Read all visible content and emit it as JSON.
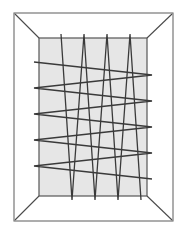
{
  "figure": {
    "canvas": {
      "width": 181,
      "height": 236,
      "background": "#ffffff"
    },
    "colors": {
      "outer_boundary_stroke": "#6b6b6b",
      "inner_region_fill": "#e6e6e6",
      "inner_region_stroke": "#555555",
      "path_stroke": "#3a3a3a",
      "corner_link_stroke": "#4a4a4a"
    },
    "stroke_widths": {
      "outer_boundary": 1.1,
      "inner_region": 1.2,
      "path": 1.3,
      "corner_link": 1.1
    },
    "outer_boundary": {
      "x": 14,
      "y": 13,
      "width": 159,
      "height": 208
    },
    "inner_region": {
      "x": 39,
      "y": 38,
      "width": 108,
      "height": 158
    },
    "corner_links": [
      {
        "name": "top-left",
        "x1": 15,
        "y1": 14,
        "x2": 39,
        "y2": 38
      },
      {
        "name": "top-right",
        "x1": 172,
        "y1": 14,
        "x2": 147,
        "y2": 38
      },
      {
        "name": "bottom-left",
        "x1": 15,
        "y1": 220,
        "x2": 39,
        "y2": 196
      },
      {
        "name": "bottom-right",
        "x1": 172,
        "y1": 220,
        "x2": 147,
        "y2": 196
      }
    ],
    "vertical_sweep": {
      "label": "vertical zigzag sweep",
      "overshoot_top": 4,
      "overshoot_bottom": 4,
      "points": [
        [
          61,
          34
        ],
        [
          72,
          200
        ],
        [
          84,
          34
        ],
        [
          95,
          200
        ],
        [
          107,
          34
        ],
        [
          118,
          200
        ],
        [
          130,
          34
        ],
        [
          141,
          200
        ]
      ]
    },
    "horizontal_sweep": {
      "label": "horizontal zigzag sweep",
      "overshoot_left": 5,
      "overshoot_right": 5,
      "points": [
        [
          34,
          62
        ],
        [
          152,
          75
        ],
        [
          34,
          88
        ],
        [
          152,
          101
        ],
        [
          34,
          114
        ],
        [
          152,
          127
        ],
        [
          34,
          140
        ],
        [
          152,
          153
        ],
        [
          34,
          166
        ],
        [
          152,
          179
        ]
      ]
    }
  }
}
